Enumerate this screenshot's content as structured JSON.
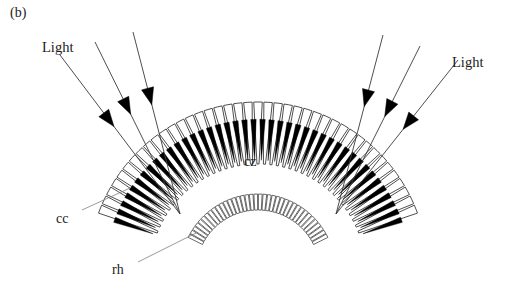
{
  "figure": {
    "panel_label": "(b)",
    "type": "biological-diagram",
    "background_color": "#ffffff",
    "line_color": "#3a3a3a",
    "pigment_color": "#000000",
    "text_color": "#1a1a1a"
  },
  "labels": {
    "light_left": "Light",
    "light_right": "Light",
    "cone_zone": "cz",
    "corneal_cone": "cc",
    "rhabdom": "rh"
  },
  "geometry": {
    "center_x": 258,
    "center_y": 272,
    "cone_inner_radius": 108,
    "cone_outer_radius": 170,
    "cone_count": 41,
    "arc_start_deg": 200,
    "arc_end_deg": 340,
    "rhabdom_inner_radius": 62,
    "rhabdom_outer_radius": 78,
    "rhabdom_count": 38,
    "focus_left_x": 180,
    "focus_left_y": 214,
    "focus_right_x": 336,
    "focus_right_y": 214
  },
  "light_rays_left": [
    {
      "x1": 60,
      "y1": 55,
      "x2": 180,
      "y2": 214,
      "arrow_t": 0.45
    },
    {
      "x1": 95,
      "y1": 42,
      "x2": 180,
      "y2": 214,
      "arrow_t": 0.42
    },
    {
      "x1": 133,
      "y1": 32,
      "x2": 180,
      "y2": 214,
      "arrow_t": 0.4
    }
  ],
  "light_rays_right": [
    {
      "x1": 458,
      "y1": 60,
      "x2": 336,
      "y2": 214,
      "arrow_t": 0.45
    },
    {
      "x1": 420,
      "y1": 46,
      "x2": 336,
      "y2": 214,
      "arrow_t": 0.42
    },
    {
      "x1": 383,
      "y1": 35,
      "x2": 336,
      "y2": 214,
      "arrow_t": 0.4
    }
  ],
  "leader_lines": {
    "cc": {
      "x1": 82,
      "y1": 210,
      "x2": 130,
      "y2": 188
    },
    "rh": {
      "x1": 138,
      "y1": 262,
      "x2": 196,
      "y2": 233
    }
  }
}
